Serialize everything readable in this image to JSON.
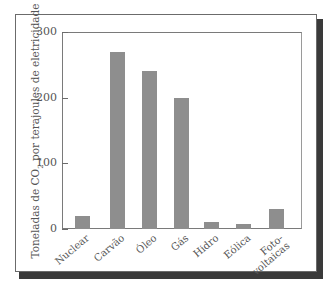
{
  "chart_data": {
    "type": "bar",
    "title": "",
    "xlabel": "",
    "ylabel": "Toneladas de CO2 por terajoules de eletricidade",
    "ylabel_parts": {
      "pre": "Toneladas de CO",
      "sub": "2",
      "post": " por terajoules de eletricidade"
    },
    "categories": [
      "Nuclear",
      "Carvão",
      "Óleo",
      "Gás",
      "Hidro",
      "Eólica",
      "Foto-voltaicas"
    ],
    "category_lines": [
      [
        "Nuclear"
      ],
      [
        "Carvão"
      ],
      [
        "Óleo"
      ],
      [
        "Gás"
      ],
      [
        "Hidro"
      ],
      [
        "Eólica"
      ],
      [
        "Foto-",
        "voltaicas"
      ]
    ],
    "values": [
      20,
      270,
      240,
      200,
      10,
      8,
      30
    ],
    "ylim": [
      0,
      300
    ],
    "yticks": [
      0,
      100,
      200,
      300
    ],
    "ytick_labels": [
      "0",
      "100",
      "200",
      "300"
    ],
    "grid": false,
    "legend": null,
    "bar_color": "#8e8e8e"
  }
}
